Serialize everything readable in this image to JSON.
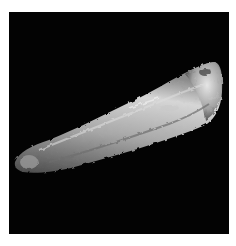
{
  "image": {
    "subject": "elongated specimen micrograph",
    "background_color": "#030303",
    "margin_color": "#ffffff",
    "specimen_colors": {
      "highlight": "#e6e6e6",
      "mid": "#a8a8a8",
      "shadow": "#4a4a4a"
    }
  }
}
